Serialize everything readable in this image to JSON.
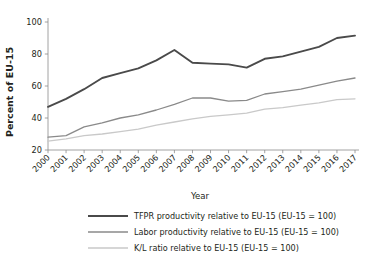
{
  "chart_data": {
    "type": "line",
    "title": "",
    "xlabel": "Year",
    "ylabel": "Percent of EU-15",
    "x": [
      2000,
      2001,
      2002,
      2003,
      2004,
      2005,
      2006,
      2007,
      2008,
      2009,
      2010,
      2011,
      2012,
      2013,
      2014,
      2015,
      2016,
      2017
    ],
    "categories": [
      "2000",
      "2001",
      "2002",
      "2003",
      "2004",
      "2005",
      "2006",
      "2007",
      "2008",
      "2009",
      "2010",
      "2011",
      "2012",
      "2013",
      "2014",
      "2015",
      "2016",
      "2017"
    ],
    "xlim": [
      2000,
      2017
    ],
    "ylim": [
      14,
      104
    ],
    "yticks": [
      20,
      40,
      60,
      80,
      100
    ],
    "ytick_labels": [
      "20",
      "40",
      "60",
      "80",
      "100"
    ],
    "grid": false,
    "legend_position": "below",
    "series": [
      {
        "name": "TFPR productivity relative to EU-15 (EU-15 = 100)",
        "color": "#4a4a4a",
        "width": 1.9,
        "values": [
          47,
          52,
          58,
          65,
          68,
          71,
          76,
          82.5,
          74.5,
          74,
          73.5,
          71.5,
          77,
          78.5,
          81.5,
          84.5,
          90,
          91.5
        ]
      },
      {
        "name": "Labor productivity relative to EU-15 (EU-15 = 100)",
        "color": "#8a8a8a",
        "width": 1.3,
        "values": [
          28,
          29,
          34.5,
          37,
          40,
          42,
          45,
          48.5,
          52.5,
          52.5,
          50.5,
          51,
          55,
          56.5,
          58,
          60.5,
          63,
          65
        ]
      },
      {
        "name": "K/L ratio relative to EU-15 (EU-15 = 100)",
        "color": "#c9c9c9",
        "width": 1.3,
        "values": [
          25.5,
          27,
          29,
          30,
          31.5,
          33,
          35.5,
          37.5,
          39.5,
          41,
          42,
          43,
          45.5,
          46.5,
          48,
          49.5,
          51.5,
          52
        ]
      }
    ]
  },
  "axes": {
    "ylabel": "Percent of EU-15",
    "xlabel": "Year"
  },
  "legend": {
    "items": [
      {
        "label": "TFPR productivity relative to EU-15 (EU-15 = 100)",
        "color": "#4a4a4a"
      },
      {
        "label": "Labor productivity relative to EU-15 (EU-15 = 100)",
        "color": "#8a8a8a"
      },
      {
        "label": "K/L ratio relative to EU-15 (EU-15 = 100)",
        "color": "#c9c9c9"
      }
    ]
  }
}
